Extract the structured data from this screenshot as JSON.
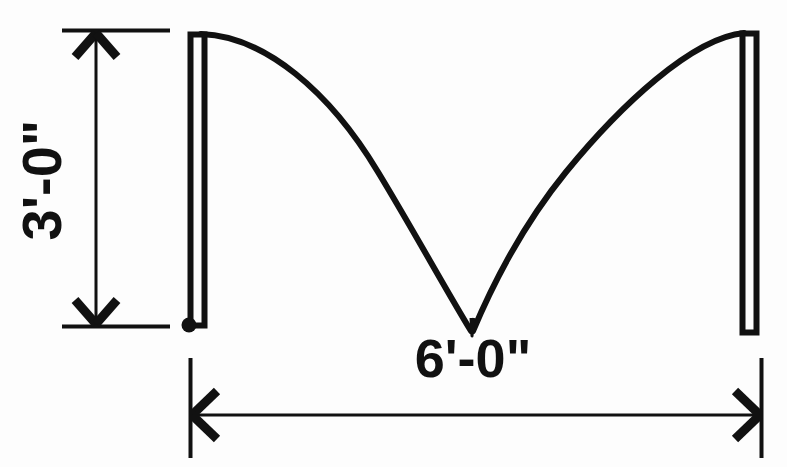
{
  "drawing": {
    "title": "Cable sag elevation detail",
    "background_color": "#fdfdfd",
    "ink_color": "#111111",
    "dimensions": {
      "vertical": {
        "label": "3'-0\"",
        "orientation": "vertical",
        "text_rotation_deg": -90,
        "measures": "post height"
      },
      "horizontal": {
        "label": "6'-0\"",
        "orientation": "horizontal",
        "text_rotation_deg": 0,
        "measures": "span between posts"
      }
    },
    "elements": {
      "left_post_label": "left post",
      "right_post_label": "right post",
      "cable_label": "sagging cable",
      "anchor_point_label": "base anchor point"
    },
    "geometry": {
      "left_post": {
        "x": 188,
        "y": 32,
        "width": 17,
        "height": 295
      },
      "right_post": {
        "x": 740,
        "y": 31,
        "width": 17,
        "height": 303
      },
      "anchor_dot": {
        "cx": 189,
        "cy": 325,
        "r": 7
      },
      "cable_left_start": {
        "x": 200,
        "y": 35
      },
      "cable_low_point": {
        "x": 472,
        "y": 332
      },
      "cable_right_end": {
        "x": 745,
        "y": 33
      },
      "vertical_dim_line_x": 96,
      "vertical_dim_top_y": 32,
      "vertical_dim_bottom_y": 326,
      "horizontal_dim_line_y": 415,
      "horizontal_dim_left_x": 190,
      "horizontal_dim_right_x": 762
    }
  }
}
